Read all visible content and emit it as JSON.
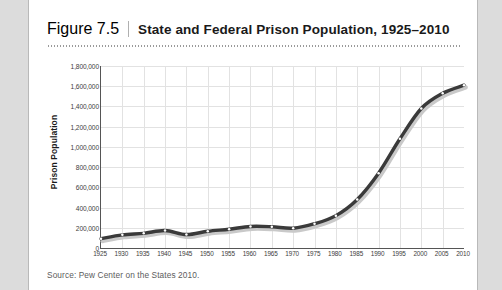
{
  "figure": {
    "number": "Figure 7.5",
    "title": "State and Federal Prison Population, 1925–2010",
    "source": "Source: Pew Center on the States 2010."
  },
  "colors": {
    "line": "#3a3a3a",
    "shadow": "#c9c9c9",
    "marker": "#ffffff",
    "grid": "#e2e2e2",
    "axis": "#555555",
    "card": "#ffffff",
    "page": "#dcdcdc"
  },
  "chart_data": {
    "type": "line",
    "title": "State and Federal Prison Population, 1925–2010",
    "xlabel": "",
    "ylabel": "Prison Population",
    "xlim": [
      1925,
      2010
    ],
    "ylim": [
      0,
      1800000
    ],
    "grid": true,
    "legend": false,
    "marker": "white-circle",
    "ytick_labels": [
      "1,800,000",
      "1,600,000",
      "1,400,000",
      "1,200,000",
      "1,000,000",
      "800,000",
      "600,000",
      "400,000",
      "200,000",
      "0"
    ],
    "ytick_values": [
      1800000,
      1600000,
      1400000,
      1200000,
      1000000,
      800000,
      600000,
      400000,
      200000,
      0
    ],
    "x": [
      1925,
      1930,
      1935,
      1940,
      1945,
      1950,
      1955,
      1960,
      1965,
      1970,
      1975,
      1980,
      1985,
      1990,
      1995,
      2000,
      2005,
      2010
    ],
    "series": [
      {
        "name": "State and Federal Prison Population",
        "values": [
          92000,
          130000,
          145000,
          173000,
          133000,
          166000,
          186000,
          213000,
          210000,
          196000,
          240000,
          320000,
          480000,
          740000,
          1080000,
          1380000,
          1530000,
          1610000
        ]
      }
    ]
  }
}
